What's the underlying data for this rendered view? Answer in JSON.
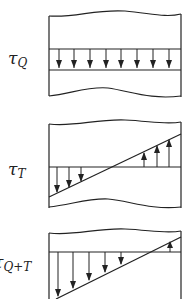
{
  "colors": {
    "stroke": "#222222",
    "background": "#ffffff"
  },
  "panels": [
    {
      "id": "direct-shear",
      "label": {
        "symbol": "τ",
        "subscript": "Q"
      },
      "description": "Uniform shear stress across the section, all arrows pointing down",
      "arrow_count": 8,
      "arrow_direction": "down"
    },
    {
      "id": "torsion",
      "label": {
        "symbol": "τ",
        "subscript": "T"
      },
      "description": "Linearly varying shear stress, downward on left, upward on right, zero crossing near center",
      "arrows_down": 3,
      "arrows_up": 3
    },
    {
      "id": "combined",
      "label": {
        "symbol": "τ",
        "subscript": "Q+T"
      },
      "description": "Superposition: linearly varying shear, mostly downward with small upward region at right edge",
      "arrows_down": 5,
      "arrows_up": 1
    }
  ]
}
